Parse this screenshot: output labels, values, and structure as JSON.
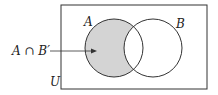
{
  "diagram": {
    "type": "venn",
    "universe_label": "U",
    "sets": [
      {
        "label": "A",
        "cx": 114,
        "cy": 48,
        "r": 29
      },
      {
        "label": "B",
        "cx": 153,
        "cy": 48,
        "r": 29
      }
    ],
    "shaded_region": "A ∩ B'",
    "annotation": {
      "text": "A ∩ B′",
      "arrow_target": "A-only region"
    },
    "colors": {
      "shade": "#d4d4d4",
      "stroke": "#333333",
      "background": "#ffffff"
    }
  }
}
